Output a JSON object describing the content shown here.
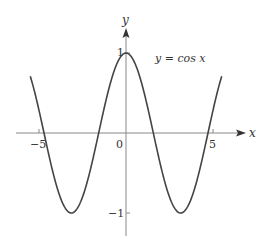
{
  "chart_data": {
    "type": "line",
    "title": "",
    "function_label": "y = cos x",
    "xlabel": "x",
    "ylabel": "y",
    "xlim": [
      -5.5,
      5.5
    ],
    "ylim": [
      -1.3,
      1.3
    ],
    "x_ticks": [
      {
        "value": -5,
        "label": "−5"
      },
      {
        "value": 5,
        "label": "5"
      }
    ],
    "y_ticks": [
      {
        "value": 1,
        "label": "1"
      },
      {
        "value": -1,
        "label": "−1"
      }
    ],
    "origin_label": "0",
    "grid": false,
    "legend": "none",
    "series": [
      {
        "name": "y = cos x",
        "x": [
          -5.5,
          -5,
          -4.5,
          -4,
          -3.5,
          -3.14,
          -3,
          -2.5,
          -2,
          -1.57,
          -1.5,
          -1,
          -0.5,
          0,
          0.5,
          1,
          1.5,
          1.57,
          2,
          2.5,
          3,
          3.14,
          3.5,
          4,
          4.5,
          5,
          5.5
        ],
        "values": [
          0.709,
          0.284,
          -0.211,
          -0.654,
          -0.936,
          -1.0,
          -0.99,
          -0.801,
          -0.416,
          0.0,
          0.071,
          0.54,
          0.878,
          1.0,
          0.878,
          0.54,
          0.071,
          0.0,
          -0.416,
          -0.801,
          -0.99,
          -1.0,
          -0.936,
          -0.654,
          -0.211,
          0.284,
          0.709
        ]
      }
    ]
  },
  "colors": {
    "curve": "#444444",
    "axis": "#888888",
    "text": "#333333"
  }
}
